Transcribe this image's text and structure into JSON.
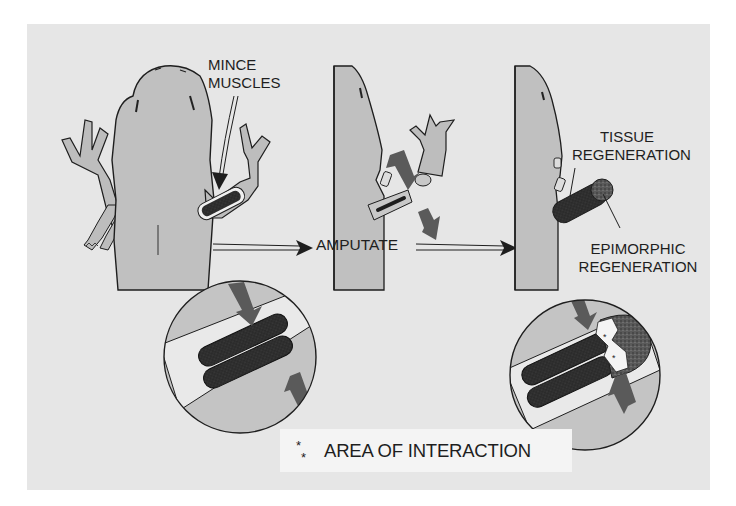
{
  "diagram": {
    "type": "limb regeneration experiment (salamander)",
    "stages": [
      {
        "id": "stage-1",
        "description": "Salamander with muscles of one forelimb minced"
      },
      {
        "id": "stage-2",
        "description": "Limb amputated through the minced muscle region"
      },
      {
        "id": "stage-3",
        "description": "Regenerating limb showing tissue and epimorphic regeneration"
      }
    ],
    "labels": {
      "mince_muscles_line1": "MINCE",
      "mince_muscles_line2": "MUSCLES",
      "amputate": "AMPUTATE",
      "tissue_regeneration_line1": "TISSUE",
      "tissue_regeneration_line2": "REGENERATION",
      "epimorphic_regeneration_line1": "EPIMORPHIC",
      "epimorphic_regeneration_line2": "REGENERATION"
    },
    "legend": {
      "symbol": "*",
      "text": "AREA OF INTERACTION"
    },
    "insets": [
      {
        "id": "inset-left",
        "description": "Magnified minced muscle within limb stump"
      },
      {
        "id": "inset-right",
        "description": "Magnified regenerating limb with blastema; asterisks mark area of interaction"
      }
    ],
    "colors": {
      "background": "#ffffff",
      "panel": "#e6e6e6",
      "body_fill": "#bdbdbd",
      "muscle_dark": "#2a2a2a",
      "arrow_gray": "#555555",
      "outline": "#1e1e1e",
      "legend_box": "#f4f4f4"
    }
  }
}
